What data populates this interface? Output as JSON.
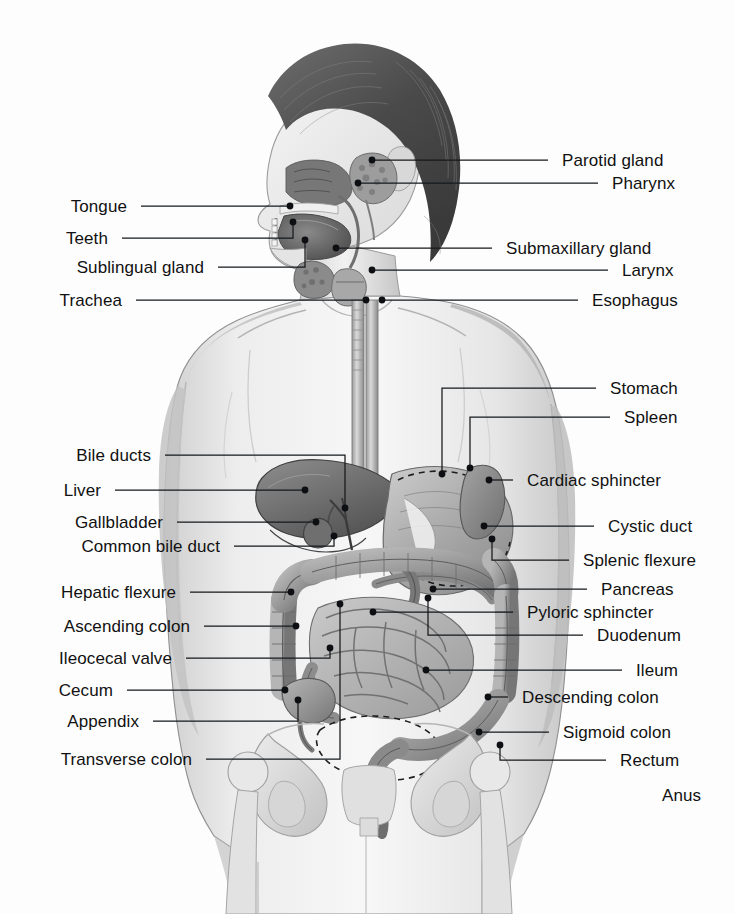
{
  "figure": {
    "type": "anatomical-illustration",
    "style": "grayscale halftone medical illustration",
    "background_color": "#fdfdfd",
    "line_color": "#15181c",
    "text_color": "#111111"
  },
  "labels_left": [
    {
      "text": "Tongue",
      "x": 127,
      "y": 206,
      "lx": 141,
      "ly": 206,
      "elbow": null,
      "tx": 290,
      "ty": 206
    },
    {
      "text": "Teeth",
      "x": 108,
      "y": 238,
      "lx": 122,
      "ly": 238,
      "elbow": {
        "x": 293
      },
      "tx": 293,
      "ty": 222
    },
    {
      "text": "Sublingual gland",
      "x": 204,
      "y": 267,
      "lx": 218,
      "ly": 267,
      "elbow": {
        "x": 305
      },
      "tx": 305,
      "ty": 240
    },
    {
      "text": "Trachea",
      "x": 122,
      "y": 300,
      "lx": 136,
      "ly": 300,
      "elbow": null,
      "tx": 366,
      "ty": 300
    },
    {
      "text": "Bile ducts",
      "x": 151,
      "y": 455,
      "lx": 165,
      "ly": 455,
      "elbow": {
        "x": 345
      },
      "tx": 345,
      "ty": 508
    },
    {
      "text": "Liver",
      "x": 101,
      "y": 490,
      "lx": 115,
      "ly": 490,
      "elbow": null,
      "tx": 305,
      "ty": 490
    },
    {
      "text": "Gallbladder",
      "x": 163,
      "y": 522,
      "lx": 177,
      "ly": 522,
      "elbow": null,
      "tx": 316,
      "ty": 522
    },
    {
      "text": "Common bile duct",
      "x": 220,
      "y": 546,
      "lx": 234,
      "ly": 546,
      "elbow": {
        "x": 334
      },
      "tx": 334,
      "ty": 536
    },
    {
      "text": "Hepatic flexure",
      "x": 176,
      "y": 592,
      "lx": 190,
      "ly": 592,
      "elbow": null,
      "tx": 291,
      "ty": 592
    },
    {
      "text": "Ascending colon",
      "x": 190,
      "y": 626,
      "lx": 204,
      "ly": 626,
      "elbow": null,
      "tx": 296,
      "ty": 626
    },
    {
      "text": "Ileocecal valve",
      "x": 172,
      "y": 658,
      "lx": 186,
      "ly": 658,
      "elbow": {
        "x": 330
      },
      "tx": 330,
      "ty": 648
    },
    {
      "text": "Cecum",
      "x": 113,
      "y": 690,
      "lx": 127,
      "ly": 690,
      "elbow": null,
      "tx": 285,
      "ty": 690
    },
    {
      "text": "Appendix",
      "x": 139,
      "y": 721,
      "lx": 153,
      "ly": 721,
      "elbow": {
        "x": 298
      },
      "tx": 298,
      "ty": 700
    },
    {
      "text": "Transverse colon",
      "x": 192,
      "y": 759,
      "lx": 206,
      "ly": 759,
      "elbow": {
        "x": 340
      },
      "tx": 340,
      "ty": 604
    }
  ],
  "labels_right": [
    {
      "text": "Parotid gland",
      "x": 562,
      "y": 160,
      "lx": 548,
      "ly": 160,
      "elbow": null,
      "tx": 372,
      "ty": 160
    },
    {
      "text": "Pharynx",
      "x": 612,
      "y": 183,
      "lx": 598,
      "ly": 183,
      "elbow": null,
      "tx": 358,
      "ty": 183
    },
    {
      "text": "Submaxillary gland",
      "x": 506,
      "y": 248,
      "lx": 492,
      "ly": 248,
      "elbow": null,
      "tx": 336,
      "ty": 248
    },
    {
      "text": "Larynx",
      "x": 622,
      "y": 270,
      "lx": 608,
      "ly": 270,
      "elbow": null,
      "tx": 372,
      "ty": 270
    },
    {
      "text": "Esophagus",
      "x": 592,
      "y": 300,
      "lx": 578,
      "ly": 300,
      "elbow": null,
      "tx": 382,
      "ty": 300
    },
    {
      "text": "Stomach",
      "x": 610,
      "y": 388,
      "lx": 596,
      "ly": 388,
      "elbow": {
        "x": 442
      },
      "tx": 442,
      "ty": 474
    },
    {
      "text": "Spleen",
      "x": 624,
      "y": 417,
      "lx": 610,
      "ly": 417,
      "elbow": {
        "x": 470
      },
      "tx": 470,
      "ty": 468
    },
    {
      "text": "Cardiac sphincter",
      "x": 527,
      "y": 480,
      "lx": 513,
      "ly": 480,
      "elbow": null,
      "tx": 489,
      "ty": 480
    },
    {
      "text": "Cystic duct",
      "x": 608,
      "y": 526,
      "lx": 594,
      "ly": 526,
      "elbow": null,
      "tx": 484,
      "ty": 526
    },
    {
      "text": "Splenic flexure",
      "x": 583,
      "y": 560,
      "lx": 569,
      "ly": 560,
      "elbow": {
        "x": 492
      },
      "tx": 492,
      "ty": 539
    },
    {
      "text": "Pancreas",
      "x": 601,
      "y": 589,
      "lx": 587,
      "ly": 589,
      "elbow": null,
      "tx": 433,
      "ty": 589
    },
    {
      "text": "Pyloric sphincter",
      "x": 527,
      "y": 612,
      "lx": 513,
      "ly": 612,
      "elbow": null,
      "tx": 373,
      "ty": 612
    },
    {
      "text": "Duodenum",
      "x": 597,
      "y": 635,
      "lx": 583,
      "ly": 635,
      "elbow": {
        "x": 428
      },
      "tx": 428,
      "ty": 598
    },
    {
      "text": "Ileum",
      "x": 636,
      "y": 670,
      "lx": 622,
      "ly": 670,
      "elbow": null,
      "tx": 426,
      "ty": 670
    },
    {
      "text": "Descending colon",
      "x": 522,
      "y": 697,
      "lx": 508,
      "ly": 697,
      "elbow": null,
      "tx": 488,
      "ty": 697
    },
    {
      "text": "Sigmoid colon",
      "x": 563,
      "y": 732,
      "lx": 549,
      "ly": 732,
      "elbow": null,
      "tx": 479,
      "ty": 732
    },
    {
      "text": "Rectum",
      "x": 620,
      "y": 760,
      "lx": 606,
      "ly": 760,
      "elbow": {
        "x": 500
      },
      "tx": 500,
      "ty": 745
    },
    {
      "text": "Anus",
      "x": 662,
      "y": 795,
      "lx": null,
      "ly": null,
      "elbow": null,
      "tx": null,
      "ty": null
    }
  ]
}
